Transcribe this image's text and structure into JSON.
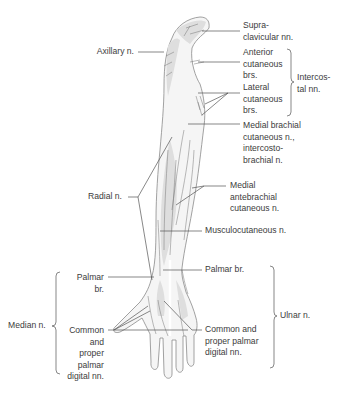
{
  "figure": {
    "labels": {
      "supraclavicular": "Supra-\nclavicular nn.",
      "axillary": "Axillary n.",
      "anterior_cutaneous": "Anterior\ncutaneous\nbrs.",
      "lateral_cutaneous": "Lateral\ncutaneous\nbrs.",
      "intercostal": "Intercos-\ntal nn.",
      "medial_brachial": "Medial brachial\ncutaneous n.,\nintercosto-\nbrachial n.",
      "radial": "Radial n.",
      "medial_antebrachial": "Medial\nantebrachial\ncutaneous n.",
      "musculocutaneous": "Musculocutaneous n.",
      "median_palmar_br": "Palmar\nbr.",
      "ulnar_palmar_br": "Palmar br.",
      "median": "Median n.",
      "median_digital": "Common\nand\nproper\npalmar\ndigital nn.",
      "ulnar_digital": "Common and\nproper palmar\ndigital nn.",
      "ulnar": "Ulnar n."
    },
    "colors": {
      "skin_fill": "#f4f4f4",
      "shade_fill": "#dcdcdc",
      "outline": "#8a8a8a",
      "leader": "#555555",
      "text": "#3c3c3c"
    }
  }
}
